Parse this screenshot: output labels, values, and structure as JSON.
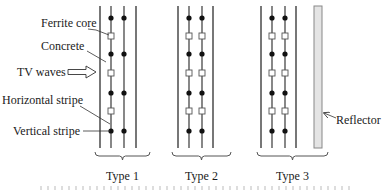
{
  "diagram": {
    "labels": {
      "ferrite_core": "Ferrite core",
      "concrete": "Concrete",
      "tv_waves": "TV waves",
      "horizontal_stripe": "Horizontal stripe",
      "vertical_stripe": "Vertical stripe",
      "reflector": "Reflector"
    },
    "types": [
      {
        "label": "Type 1",
        "outer_x": [
          100,
          136
        ],
        "stripes": [
          {
            "x": 111,
            "pattern": [
              "dot",
              "core",
              "dot",
              "core",
              "dot",
              "core",
              "dot"
            ]
          },
          {
            "x": 124,
            "pattern": [
              "dot",
              null,
              "dot",
              null,
              "dot",
              null,
              "dot"
            ]
          }
        ],
        "brace": [
          95,
          150
        ],
        "reflector": false
      },
      {
        "label": "Type 2",
        "outer_x": [
          178,
          213
        ],
        "stripes": [
          {
            "x": 189,
            "pattern": [
              "dot",
              "core",
              "dot",
              "core",
              "dot",
              "core",
              "dot"
            ]
          },
          {
            "x": 202,
            "pattern": [
              "dot",
              "core",
              "dot",
              "core",
              "dot",
              "core",
              "dot"
            ]
          }
        ],
        "brace": [
          172,
          231
        ],
        "reflector": false
      },
      {
        "label": "Type 3",
        "outer_x": [
          261,
          296
        ],
        "stripes": [
          {
            "x": 272,
            "pattern": [
              "dot",
              "core",
              "dot",
              "core",
              "dot",
              "core",
              "dot"
            ]
          },
          {
            "x": 285,
            "pattern": [
              "dot",
              "core",
              "dot",
              "core",
              "dot",
              "core",
              "dot"
            ]
          }
        ],
        "brace": [
          257,
          328
        ],
        "reflector": true
      }
    ],
    "marker_y": [
      18,
      36,
      54,
      73,
      93,
      111,
      131
    ],
    "line_top": 6,
    "line_bottom": 148,
    "reflector_rect": {
      "x": 314,
      "y": 6,
      "w": 8,
      "h": 142
    }
  }
}
